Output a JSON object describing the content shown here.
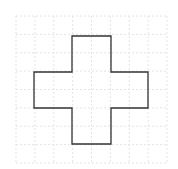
{
  "diagram": {
    "type": "grid-shape",
    "shape": "cross",
    "grid": {
      "x0": 16,
      "y0": 16,
      "x1": 167,
      "y1": 163,
      "cols": 8,
      "rows": 8,
      "color": "#e4e4e4"
    },
    "outline": {
      "color": "#333333",
      "points": "72,36 111,36 111,72 148,72 148,108 111,108 111,144 72,144 72,108 34,108 34,72 72,72"
    }
  }
}
